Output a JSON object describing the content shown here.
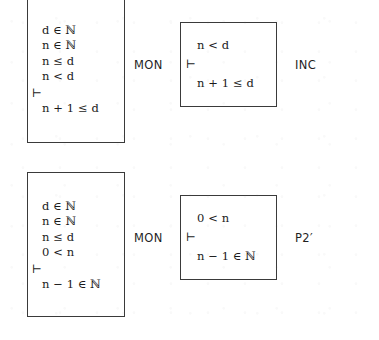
{
  "diagram": {
    "type": "proof-rule-diagram",
    "ink_color": "#1a1a1a",
    "border_color": "#3a3a3a",
    "background_color": "#ffffff"
  },
  "derivations": [
    {
      "id": "inc",
      "rule_label_left": "MON",
      "rule_label_right": "INC",
      "premise_box": {
        "name": "premise-sequent-inc",
        "lines": [
          {
            "text": "d ∈ ℕ",
            "kind": "hypothesis"
          },
          {
            "text": "n ∈ ℕ",
            "kind": "hypothesis"
          },
          {
            "text": "n ≤ d",
            "kind": "hypothesis"
          },
          {
            "text": "n < d",
            "kind": "hypothesis"
          },
          {
            "text": "⊢",
            "kind": "turnstile"
          },
          {
            "text": "n + 1 ≤ d",
            "kind": "conclusion"
          }
        ]
      },
      "conclusion_box": {
        "name": "conclusion-sequent-inc",
        "lines": [
          {
            "text": "n < d",
            "kind": "hypothesis"
          },
          {
            "text": "⊢",
            "kind": "turnstile"
          },
          {
            "text": "n + 1 ≤ d",
            "kind": "conclusion"
          }
        ]
      }
    },
    {
      "id": "p2prime",
      "rule_label_left": "MON",
      "rule_label_right": "P2′",
      "premise_box": {
        "name": "premise-sequent-p2prime",
        "lines": [
          {
            "text": "d ∈ ℕ",
            "kind": "hypothesis"
          },
          {
            "text": "n ∈ ℕ",
            "kind": "hypothesis"
          },
          {
            "text": "n ≤ d",
            "kind": "hypothesis"
          },
          {
            "text": "0 < n",
            "kind": "hypothesis"
          },
          {
            "text": "⊢",
            "kind": "turnstile"
          },
          {
            "text": "n − 1 ∈ ℕ",
            "kind": "conclusion"
          }
        ]
      },
      "conclusion_box": {
        "name": "conclusion-sequent-p2prime",
        "lines": [
          {
            "text": "0 < n",
            "kind": "hypothesis"
          },
          {
            "text": "⊢",
            "kind": "turnstile"
          },
          {
            "text": "n − 1 ∈ ℕ",
            "kind": "conclusion"
          }
        ]
      }
    }
  ]
}
